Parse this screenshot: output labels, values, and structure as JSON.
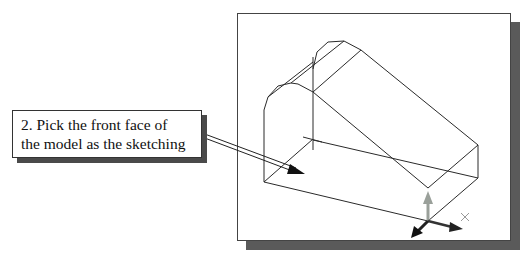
{
  "callout": {
    "step_number": "2.",
    "line1": "2. Pick the front face of",
    "line2": "the model as the sketching"
  },
  "viewport": {
    "content": "isometric wireframe of 3D solid model",
    "triad": "coordinate-axes-triad"
  },
  "colors": {
    "line": "#222222",
    "shadow": "#555555",
    "triad_vertical": "#9aa09a",
    "triad_dark": "#222222"
  }
}
